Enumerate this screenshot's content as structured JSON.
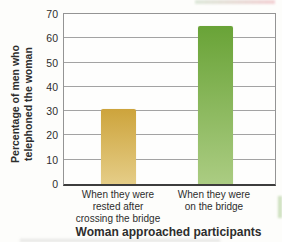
{
  "chart_data": {
    "type": "bar",
    "xlabel": "Woman approached participants",
    "ylabel": "Percentage of men who telephoned the woman",
    "ylabel_lines": [
      "Percentage of men who",
      "telephoned the woman"
    ],
    "categories": [
      "When they were rested after crossing the bridge",
      "When they were on the bridge"
    ],
    "categories_lines": [
      [
        "When they were",
        "rested after",
        "crossing the bridge"
      ],
      [
        "When they were",
        "on the bridge"
      ]
    ],
    "values": [
      31,
      65
    ],
    "ylim": [
      0,
      70
    ],
    "yticks": [
      0,
      10,
      20,
      30,
      40,
      50,
      60,
      70
    ],
    "grid": "horizontal",
    "legend": "none",
    "bar_colors": [
      {
        "top": "#cda43c",
        "bottom": "#e5cd87"
      },
      {
        "top": "#69a337",
        "bottom": "#abcc82"
      }
    ],
    "gridline_color": "#a3a3a3",
    "border_color": "#949494",
    "axis_line_color": "#3d3d3d",
    "text_color": "#2d2d2d"
  }
}
